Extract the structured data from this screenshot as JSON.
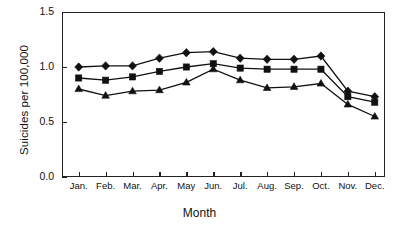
{
  "chart_data": {
    "type": "line",
    "title": "",
    "xlabel": "Month",
    "ylabel": "Suicides per 100,000",
    "categories": [
      "Jan.",
      "Feb.",
      "Mar.",
      "Apr.",
      "May",
      "Jun.",
      "Jul.",
      "Aug.",
      "Sep.",
      "Oct.",
      "Nov.",
      "Dec."
    ],
    "ylim": [
      0.0,
      1.5
    ],
    "yticks": [
      "0.0",
      "0.5",
      "1.0",
      "1.5"
    ],
    "ytick_values": [
      0.0,
      0.5,
      1.0,
      1.5
    ],
    "grid": false,
    "legend": "none",
    "series": [
      {
        "name": "diamond-series",
        "marker": "diamond",
        "values": [
          1.0,
          1.01,
          1.01,
          1.08,
          1.13,
          1.14,
          1.08,
          1.07,
          1.07,
          1.1,
          0.78,
          0.73
        ]
      },
      {
        "name": "square-series",
        "marker": "square",
        "values": [
          0.9,
          0.88,
          0.91,
          0.96,
          1.0,
          1.03,
          0.99,
          0.98,
          0.98,
          0.98,
          0.73,
          0.68
        ]
      },
      {
        "name": "triangle-series",
        "marker": "triangle",
        "values": [
          0.8,
          0.74,
          0.78,
          0.79,
          0.86,
          0.98,
          0.88,
          0.81,
          0.82,
          0.85,
          0.66,
          0.55
        ]
      }
    ]
  }
}
